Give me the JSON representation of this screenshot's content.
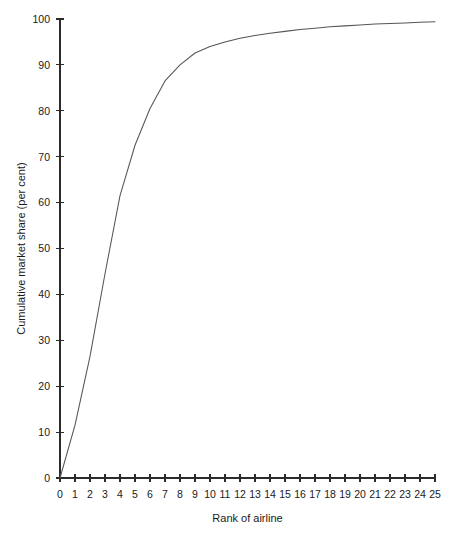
{
  "chart_data": {
    "type": "line",
    "title": "",
    "xlabel": "Rank of airline",
    "ylabel": "Cumulative market share (per cent)",
    "xlim": [
      0,
      25
    ],
    "ylim": [
      0,
      100
    ],
    "grid": false,
    "legend": null,
    "xticks": [
      0,
      1,
      2,
      3,
      4,
      5,
      6,
      7,
      8,
      9,
      10,
      11,
      12,
      13,
      14,
      15,
      16,
      17,
      18,
      19,
      20,
      21,
      22,
      23,
      24,
      25
    ],
    "xtick_labels": [
      "0",
      "1",
      "2",
      "3",
      "4",
      "5",
      "6",
      "7",
      "8",
      "9",
      "10",
      "11",
      "12",
      "13",
      "14",
      "15",
      "16",
      "17",
      "18",
      "19",
      "20",
      "21",
      "22",
      "23",
      "24",
      "25"
    ],
    "yticks": [
      0,
      10,
      20,
      30,
      40,
      50,
      60,
      70,
      80,
      90,
      100
    ],
    "ytick_labels": [
      "0",
      "10",
      "20",
      "30",
      "40",
      "50",
      "60",
      "70",
      "80",
      "90",
      "100"
    ],
    "series": [
      {
        "name": "Cumulative market share",
        "color": "#555555",
        "x": [
          0,
          1,
          2,
          3,
          4,
          5,
          6,
          7,
          8,
          9,
          10,
          11,
          12,
          13,
          14,
          15,
          16,
          17,
          18,
          19,
          20,
          21,
          22,
          23,
          24,
          25
        ],
        "values": [
          0,
          11.5,
          26.5,
          44.5,
          61.5,
          72.5,
          80.5,
          86.5,
          90.0,
          92.6,
          94.0,
          95.0,
          95.8,
          96.4,
          96.9,
          97.3,
          97.7,
          98.0,
          98.3,
          98.5,
          98.7,
          98.9,
          99.0,
          99.15,
          99.3,
          99.4
        ]
      }
    ]
  },
  "geometry": {
    "plot_left": 60,
    "plot_right": 435,
    "plot_top": 19,
    "plot_bottom": 478
  }
}
